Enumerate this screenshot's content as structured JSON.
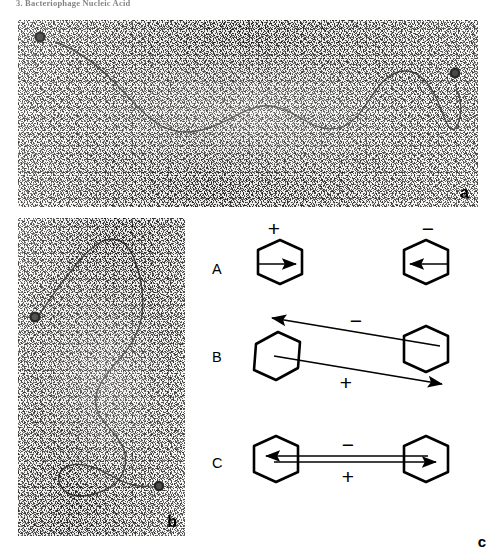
{
  "running_head": "3.  Bacteriophage Nucleic Acid",
  "figure": {
    "panels": [
      {
        "id": "a",
        "label": "a",
        "type": "electron-micrograph",
        "description": "Horizontal DNA filament with dark bead markers at both ends",
        "markers": 2
      },
      {
        "id": "b",
        "label": "b",
        "type": "electron-micrograph",
        "description": "Vertical DNA filament with dark bead markers",
        "markers": 2
      },
      {
        "id": "c",
        "label": "c",
        "type": "schematic-diagram",
        "description": "Three arrangements of hexagonal particles with polarity arrows"
      }
    ]
  },
  "schematic": {
    "rows": [
      {
        "letter": "A",
        "units": [
          {
            "sign": "+",
            "arrow": "right"
          },
          {
            "sign": "−",
            "arrow": "left"
          }
        ]
      },
      {
        "letter": "B",
        "arrows": [
          {
            "sign": "−",
            "direction": "left",
            "position": "upper"
          },
          {
            "sign": "+",
            "direction": "right",
            "position": "lower"
          }
        ]
      },
      {
        "letter": "C",
        "arrows": [
          {
            "sign": "−",
            "direction": "left",
            "position": "upper"
          },
          {
            "sign": "+",
            "direction": "right",
            "position": "lower"
          }
        ]
      }
    ]
  },
  "colors": {
    "ink": "#000000",
    "film_base": "#f2f1ef",
    "filament": "#2a2a2a",
    "bead": "#0d0d0d"
  }
}
